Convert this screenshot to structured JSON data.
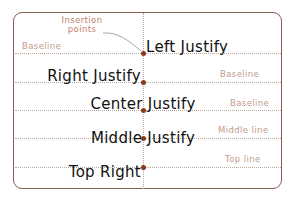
{
  "diagram": {
    "annotation": {
      "line1": "Insertion",
      "line2": "points"
    },
    "rows": [
      {
        "text": "Left Justify",
        "justify": "left-baseline",
        "guide_label": "Baseline",
        "guide_side": "left"
      },
      {
        "text": "Right Justify",
        "justify": "right-baseline",
        "guide_label": "Baseline",
        "guide_side": "right"
      },
      {
        "text": "Center Justify",
        "justify": "center-baseline",
        "guide_label": "Baseline",
        "guide_side": "right"
      },
      {
        "text": "Middle Justify",
        "justify": "middle",
        "guide_label": "Middle line",
        "guide_side": "right"
      },
      {
        "text": "Top Right",
        "justify": "top-right",
        "guide_label": "Top line",
        "guide_side": "right"
      }
    ],
    "colors": {
      "frame": "#8c5d50",
      "dot": "#8a3a22",
      "guide_label": "#c49a8a",
      "annotation": "#c2826b",
      "dotted_line": "#b9a7a0",
      "text": "#111111"
    }
  }
}
